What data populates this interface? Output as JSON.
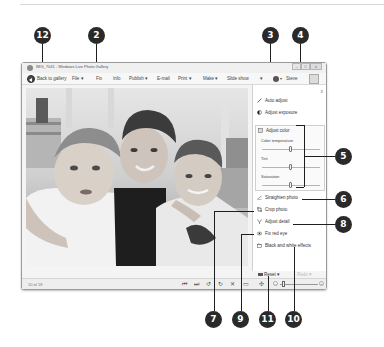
{
  "window": {
    "title": "IMG_7041 - Windows Live Photo Gallery",
    "controls": {
      "minimize": "–",
      "maximize": "□",
      "close": "x"
    }
  },
  "toolbar": {
    "back_label": "Back to gallery",
    "items": [
      {
        "label": "File ▾"
      },
      {
        "label": "Fix"
      },
      {
        "label": "Info"
      },
      {
        "label": "Publish ▾"
      },
      {
        "label": "E-mail"
      },
      {
        "label": "Print ▾"
      },
      {
        "label": "Make ▾"
      },
      {
        "label": "Slide show"
      },
      {
        "label": "▾"
      }
    ],
    "help_caret": "▾",
    "sign_in_label": "Steve"
  },
  "edit_pane": {
    "close": "x",
    "items": [
      {
        "label": "Auto adjust",
        "icon": "wand-icon"
      },
      {
        "label": "Adjust exposure",
        "icon": "exposure-icon"
      },
      {
        "label": "Adjust color",
        "icon": "color-icon"
      }
    ],
    "sliders": [
      {
        "label": "Color temperature",
        "position": 0.5
      },
      {
        "label": "Tint",
        "position": 0.5
      },
      {
        "label": "Saturation",
        "position": 0.5
      }
    ],
    "more_items": [
      {
        "label": "Straighten photo",
        "icon": "straighten-icon"
      },
      {
        "label": "Crop photo",
        "icon": "crop-icon"
      },
      {
        "label": "Adjust detail",
        "icon": "detail-icon"
      },
      {
        "label": "Fix red eye",
        "icon": "eye-icon"
      },
      {
        "label": "Black and white effects",
        "icon": "bw-effects-icon"
      }
    ],
    "reset_label": "Reset ▾",
    "redo_label": "Redo ▾"
  },
  "statusbar": {
    "count": "10 of 18",
    "buttons": [
      {
        "glyph": "⏮",
        "name": "previous-button"
      },
      {
        "glyph": "⏭",
        "name": "next-button"
      },
      {
        "glyph": "↺",
        "name": "rotate-left-button"
      },
      {
        "glyph": "↻",
        "name": "rotate-right-button"
      },
      {
        "glyph": "✕",
        "name": "delete-button"
      },
      {
        "glyph": "▭",
        "name": "fit-button"
      },
      {
        "glyph": "✣",
        "name": "actual-size-button"
      }
    ],
    "zoom_minus": "–",
    "zoom_plus": "+"
  },
  "callouts": [
    {
      "number": "12"
    },
    {
      "number": "2"
    },
    {
      "number": "3"
    },
    {
      "number": "4"
    },
    {
      "number": "5"
    },
    {
      "number": "6"
    },
    {
      "number": "8"
    },
    {
      "number": "7"
    },
    {
      "number": "9"
    },
    {
      "number": "11"
    },
    {
      "number": "10"
    }
  ]
}
